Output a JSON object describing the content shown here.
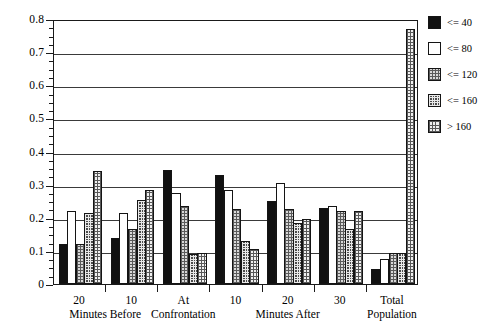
{
  "chart_data": {
    "type": "bar",
    "title": "",
    "subtitle": "",
    "xlabel": "",
    "ylabel": "",
    "ylim": [
      0,
      0.8
    ],
    "yticks": [
      "0",
      "0.1",
      "0.2",
      "0.3",
      "0.4",
      "0.5",
      "0.6",
      "0.7",
      "0.8"
    ],
    "ytick_values": [
      0,
      0.1,
      0.2,
      0.3,
      0.4,
      0.5,
      0.6,
      0.7,
      0.8
    ],
    "y_minor_tick_step": 0.025,
    "grid": true,
    "grid_axis": "y",
    "legend_position": "right",
    "categories": [
      "20",
      "10",
      "At Confrontation",
      "10",
      "20",
      "30",
      "Total Population"
    ],
    "category_tick_labels": [
      "20",
      "10",
      "At",
      "10",
      "20",
      "30",
      "Total"
    ],
    "category_sub_labels": [
      "",
      "",
      "Confrontation",
      "",
      "",
      "",
      "Population"
    ],
    "group_brackets": [
      {
        "label": "Minutes Before",
        "categories": [
          "20",
          "10"
        ]
      },
      {
        "label": "Minutes After",
        "categories": [
          "10",
          "20",
          "30"
        ]
      }
    ],
    "series": [
      {
        "name": "<= 40",
        "swatch": "solid-black",
        "values": [
          0.12,
          0.14,
          0.345,
          0.33,
          0.25,
          0.23,
          0.045
        ]
      },
      {
        "name": "<= 80",
        "swatch": "open-white",
        "values": [
          0.22,
          0.215,
          0.275,
          0.285,
          0.305,
          0.235,
          0.075
        ]
      },
      {
        "name": "<= 120",
        "swatch": "gray-checker",
        "values": [
          0.12,
          0.165,
          0.235,
          0.225,
          0.225,
          0.22,
          0.095
        ]
      },
      {
        "name": "<= 160",
        "swatch": "dark-dotted",
        "values": [
          0.215,
          0.255,
          0.09,
          0.13,
          0.185,
          0.165,
          0.095
        ]
      },
      {
        "name": "> 160",
        "swatch": "light-dotted",
        "values": [
          0.34,
          0.285,
          0.095,
          0.105,
          0.195,
          0.22,
          0.77
        ]
      }
    ]
  },
  "legend": {
    "items": [
      {
        "label": "<= 40"
      },
      {
        "label": "<= 80"
      },
      {
        "label": "<= 120"
      },
      {
        "label": "<= 160"
      },
      {
        "label": "> 160"
      }
    ]
  },
  "axis": {
    "x_group_labels": [
      "Minutes Before",
      "Minutes After"
    ]
  }
}
